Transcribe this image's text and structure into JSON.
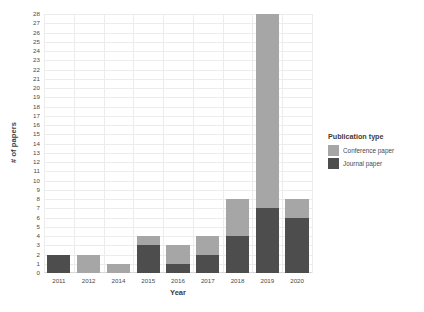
{
  "chart_data": {
    "type": "bar",
    "stacked": true,
    "title": "",
    "xlabel": "Year",
    "ylabel": "# of papers",
    "categories": [
      "2011",
      "2012",
      "2014",
      "2015",
      "2016",
      "2017",
      "2018",
      "2019",
      "2020"
    ],
    "series": [
      {
        "name": "Journal paper",
        "color": "#4d4d4d",
        "values": [
          2,
          0,
          0,
          3,
          1,
          2,
          4,
          7,
          6
        ]
      },
      {
        "name": "Conference paper",
        "color": "#a6a6a6",
        "values": [
          0,
          2,
          1,
          1,
          2,
          2,
          4,
          21,
          2
        ]
      }
    ],
    "totals": [
      2,
      2,
      1,
      4,
      3,
      4,
      8,
      28,
      8
    ],
    "ylim": [
      0,
      28
    ],
    "ytick_step": 1,
    "yticks": [
      "0",
      "1",
      "2",
      "3",
      "4",
      "5",
      "6",
      "7",
      "8",
      "9",
      "10",
      "11",
      "12",
      "13",
      "14",
      "15",
      "16",
      "17",
      "18",
      "19",
      "20",
      "21",
      "22",
      "23",
      "24",
      "25",
      "26",
      "27",
      "28"
    ],
    "grid": true,
    "legend_position": "right"
  },
  "legend": {
    "title": "Publication type",
    "entries": [
      {
        "label": "Conference paper",
        "color": "#a6a6a6"
      },
      {
        "label": "Journal paper",
        "color": "#4d4d4d"
      }
    ]
  }
}
